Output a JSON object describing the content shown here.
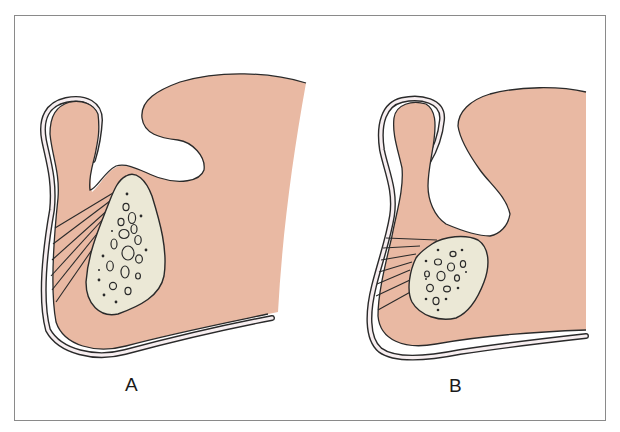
{
  "figure": {
    "panels": [
      {
        "id": "A",
        "label": "A",
        "description": "cross-section with tall triangular bony structure and fibrous bands"
      },
      {
        "id": "B",
        "label": "B",
        "description": "cross-section with smaller rounded bony structure and fibrous bands"
      }
    ]
  },
  "colors": {
    "tissue": "#e9b9a3",
    "bone": "#ebe8d6",
    "outline": "#2a2a2a",
    "membrane": "#f7eef0",
    "frame": "#8a8a8a",
    "background": "#ffffff"
  }
}
